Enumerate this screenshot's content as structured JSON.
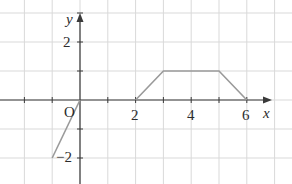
{
  "chart_data": {
    "type": "line",
    "title": "",
    "xlabel": "x",
    "ylabel": "y",
    "origin_label": "O",
    "xlim": [
      -2.8,
      6.8
    ],
    "ylim": [
      -2.9,
      3.0
    ],
    "grid": true,
    "x_tick_labels": [
      {
        "value": 2,
        "label": "2"
      },
      {
        "value": 4,
        "label": "4"
      },
      {
        "value": 6,
        "label": "6"
      }
    ],
    "y_tick_labels": [
      {
        "value": 2,
        "label": "2"
      },
      {
        "value": -2,
        "label": "−2"
      }
    ],
    "series": [
      {
        "name": "segment-1",
        "points": [
          [
            -1,
            -2
          ],
          [
            0,
            0
          ]
        ]
      },
      {
        "name": "segment-2",
        "points": [
          [
            2,
            0
          ],
          [
            3,
            1
          ],
          [
            5,
            1
          ],
          [
            6,
            0
          ]
        ]
      }
    ],
    "colors": {
      "grid": "#d9d9d9",
      "axis": "#3a3a3a",
      "curve": "#9a9a9a"
    }
  }
}
